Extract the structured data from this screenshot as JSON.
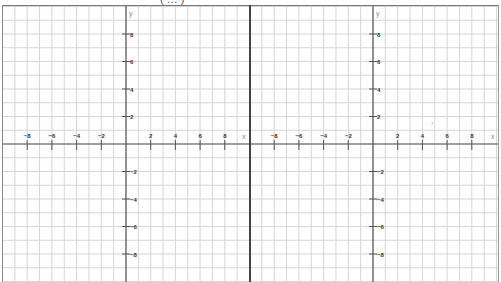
{
  "caption": "( … )",
  "colors": {
    "grid": "#d6d6d6",
    "axis": "#555555",
    "tick_label": "#333333",
    "divider": "#444444",
    "axis_name": "#888888"
  },
  "chart_data": {
    "type": "line",
    "title": "",
    "panels": [
      {
        "name": "left-grid",
        "xlabel": "x",
        "ylabel": "y",
        "xlim": [
          -10,
          10
        ],
        "ylim": [
          -10,
          10
        ],
        "grid": true,
        "x_tick_labels": [
          "-8",
          "-6",
          "-4",
          "-2",
          "2",
          "4",
          "6",
          "8"
        ],
        "y_tick_labels": [
          "8",
          "6",
          "4",
          "2",
          "-2",
          "-4",
          "-6",
          "-8"
        ],
        "series": []
      },
      {
        "name": "right-grid",
        "xlabel": "x",
        "ylabel": "y",
        "xlim": [
          -10,
          10
        ],
        "ylim": [
          -10,
          10
        ],
        "grid": true,
        "x_tick_labels": [
          "-8",
          "-6",
          "-4",
          "-2",
          "2",
          "4",
          "6",
          "8"
        ],
        "y_tick_labels": [
          "8",
          "6",
          "4",
          "2",
          "-2",
          "-4",
          "-6",
          "-8"
        ],
        "series": [],
        "annotations": [
          {
            "type": "faint-dot",
            "x": 4.8,
            "y": 1.5
          }
        ]
      }
    ]
  }
}
